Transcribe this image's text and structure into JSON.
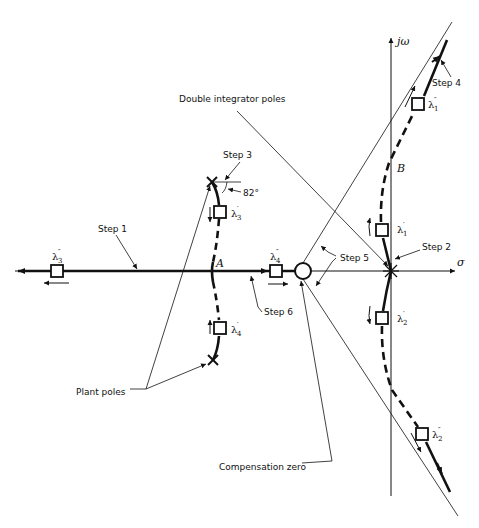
{
  "diagram": {
    "type": "root-locus",
    "axes": {
      "real_axis_label": "σ",
      "imag_axis_label": "jω"
    },
    "points": {
      "A": "A",
      "B": "B",
      "angle_label": "82°"
    },
    "annotations": {
      "double_integrator_poles": "Double integrator poles",
      "plant_poles": "Plant poles",
      "compensation_zero": "Compensation zero",
      "step1": "Step 1",
      "step2": "Step 2",
      "step3": "Step 3",
      "step4": "Step 4",
      "step5": "Step 5",
      "step6": "Step 6"
    },
    "closed_loop_poles": [
      {
        "id": "lambda1p",
        "symbol": "λ",
        "sub": "1",
        "prime": "′"
      },
      {
        "id": "lambda1pp",
        "symbol": "λ",
        "sub": "1",
        "prime": "″"
      },
      {
        "id": "lambda2p",
        "symbol": "λ",
        "sub": "2",
        "prime": "′"
      },
      {
        "id": "lambda2pp",
        "symbol": "λ",
        "sub": "2",
        "prime": "″"
      },
      {
        "id": "lambda3p",
        "symbol": "λ",
        "sub": "3",
        "prime": "′"
      },
      {
        "id": "lambda3pp",
        "symbol": "λ",
        "sub": "3",
        "prime": "″"
      },
      {
        "id": "lambda4p",
        "symbol": "λ",
        "sub": "4",
        "prime": "′"
      },
      {
        "id": "lambda4pp",
        "symbol": "λ",
        "sub": "4",
        "prime": "″"
      }
    ],
    "colors": {
      "ink": "#111111",
      "background": "#ffffff"
    }
  }
}
